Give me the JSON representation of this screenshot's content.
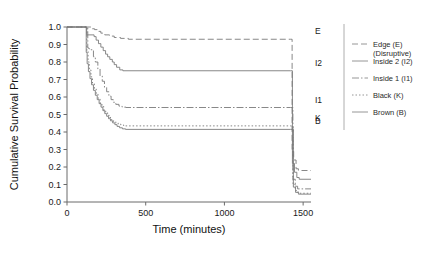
{
  "chart_data": {
    "type": "line",
    "subtype": "kaplan-meier-step",
    "title": "",
    "xlabel": "Time (minutes)",
    "ylabel": "Cumulative Survival Probability",
    "xlim": [
      0,
      1550
    ],
    "ylim": [
      0,
      1.0
    ],
    "xticks": [
      0,
      500,
      1000,
      1500
    ],
    "xtick_labels": [
      "0",
      "500",
      "1000",
      "1500"
    ],
    "yticks": [
      0.0,
      0.1,
      0.2,
      0.3,
      0.4,
      0.5,
      0.6,
      0.7,
      0.8,
      0.9,
      1.0
    ],
    "ytick_labels": [
      "0.0",
      "0.1",
      "0.2",
      "0.3",
      "0.4",
      "0.5",
      "0.6",
      "0.7",
      "0.8",
      "0.9",
      "1.0"
    ],
    "grid": false,
    "legend_position": "right",
    "series": [
      {
        "key": "E",
        "name": "Edge (E)",
        "name_line2": "(Disruptive)",
        "inplot_label": "E",
        "dash": "6,3",
        "color": "#7a7a7a",
        "plateau": 0.93,
        "points": [
          [
            0,
            1.0
          ],
          [
            150,
            1.0
          ],
          [
            160,
            0.99
          ],
          [
            175,
            0.985
          ],
          [
            195,
            0.975
          ],
          [
            215,
            0.965
          ],
          [
            240,
            0.955
          ],
          [
            270,
            0.948
          ],
          [
            300,
            0.94
          ],
          [
            340,
            0.935
          ],
          [
            390,
            0.93
          ],
          [
            1420,
            0.93
          ],
          [
            1430,
            0.3
          ],
          [
            1440,
            0.24
          ],
          [
            1455,
            0.19
          ],
          [
            1470,
            0.18
          ],
          [
            1550,
            0.18
          ]
        ]
      },
      {
        "key": "I2",
        "name": "Inside 2 (I2)",
        "name_line2": "",
        "inplot_label": "I2",
        "dash": "none",
        "color": "#6f6f6f",
        "plateau": 0.75,
        "points": [
          [
            0,
            1.0
          ],
          [
            120,
            1.0
          ],
          [
            125,
            0.955
          ],
          [
            165,
            0.955
          ],
          [
            172,
            0.945
          ],
          [
            185,
            0.925
          ],
          [
            200,
            0.905
          ],
          [
            215,
            0.885
          ],
          [
            230,
            0.865
          ],
          [
            245,
            0.845
          ],
          [
            258,
            0.83
          ],
          [
            272,
            0.815
          ],
          [
            288,
            0.8
          ],
          [
            300,
            0.785
          ],
          [
            315,
            0.77
          ],
          [
            335,
            0.755
          ],
          [
            355,
            0.75
          ],
          [
            1420,
            0.75
          ],
          [
            1432,
            0.22
          ],
          [
            1445,
            0.17
          ],
          [
            1460,
            0.14
          ],
          [
            1475,
            0.13
          ],
          [
            1550,
            0.13
          ]
        ]
      },
      {
        "key": "I1",
        "name": "Inside 1 (I1)",
        "name_line2": "",
        "inplot_label": "I1",
        "dash": "7,2,1.5,2",
        "color": "#8a8a8a",
        "plateau": 0.54,
        "points": [
          [
            0,
            1.0
          ],
          [
            128,
            1.0
          ],
          [
            132,
            0.88
          ],
          [
            140,
            0.875
          ],
          [
            152,
            0.87
          ],
          [
            168,
            0.83
          ],
          [
            180,
            0.8
          ],
          [
            196,
            0.76
          ],
          [
            210,
            0.72
          ],
          [
            224,
            0.69
          ],
          [
            238,
            0.655
          ],
          [
            252,
            0.63
          ],
          [
            266,
            0.605
          ],
          [
            280,
            0.585
          ],
          [
            294,
            0.57
          ],
          [
            310,
            0.558
          ],
          [
            330,
            0.548
          ],
          [
            350,
            0.542
          ],
          [
            375,
            0.54
          ],
          [
            1420,
            0.54
          ],
          [
            1435,
            0.13
          ],
          [
            1450,
            0.09
          ],
          [
            1465,
            0.075
          ],
          [
            1550,
            0.075
          ]
        ]
      },
      {
        "key": "K",
        "name": "Black (K)",
        "name_line2": "",
        "inplot_label": "K",
        "dash": "1.5,2",
        "color": "#8f8f8f",
        "plateau": 0.435,
        "points": [
          [
            0,
            1.0
          ],
          [
            122,
            1.0
          ],
          [
            126,
            0.86
          ],
          [
            134,
            0.8
          ],
          [
            142,
            0.755
          ],
          [
            152,
            0.715
          ],
          [
            162,
            0.68
          ],
          [
            174,
            0.645
          ],
          [
            186,
            0.615
          ],
          [
            198,
            0.59
          ],
          [
            210,
            0.565
          ],
          [
            222,
            0.545
          ],
          [
            234,
            0.525
          ],
          [
            246,
            0.51
          ],
          [
            258,
            0.495
          ],
          [
            270,
            0.483
          ],
          [
            282,
            0.47
          ],
          [
            296,
            0.46
          ],
          [
            310,
            0.452
          ],
          [
            325,
            0.445
          ],
          [
            342,
            0.44
          ],
          [
            360,
            0.435
          ],
          [
            1420,
            0.435
          ],
          [
            1436,
            0.1
          ],
          [
            1450,
            0.065
          ],
          [
            1468,
            0.05
          ],
          [
            1550,
            0.05
          ]
        ]
      },
      {
        "key": "B",
        "name": "Brown (B)",
        "name_line2": "",
        "inplot_label": "B",
        "dash": "none",
        "color": "#6a6a6a",
        "plateau": 0.415,
        "points": [
          [
            0,
            1.0
          ],
          [
            118,
            1.0
          ],
          [
            122,
            0.855
          ],
          [
            128,
            0.79
          ],
          [
            136,
            0.745
          ],
          [
            146,
            0.705
          ],
          [
            156,
            0.67
          ],
          [
            168,
            0.638
          ],
          [
            180,
            0.61
          ],
          [
            192,
            0.585
          ],
          [
            204,
            0.562
          ],
          [
            216,
            0.542
          ],
          [
            228,
            0.522
          ],
          [
            240,
            0.505
          ],
          [
            252,
            0.49
          ],
          [
            264,
            0.476
          ],
          [
            276,
            0.464
          ],
          [
            290,
            0.452
          ],
          [
            304,
            0.442
          ],
          [
            318,
            0.432
          ],
          [
            334,
            0.424
          ],
          [
            352,
            0.418
          ],
          [
            372,
            0.415
          ],
          [
            1420,
            0.415
          ],
          [
            1438,
            0.085
          ],
          [
            1452,
            0.055
          ],
          [
            1470,
            0.045
          ],
          [
            1550,
            0.045
          ]
        ]
      }
    ]
  },
  "legend": {
    "items": [
      {
        "label_line1": "Edge (E)",
        "label_line2": "(Disruptive)",
        "dash": "6,3"
      },
      {
        "label_line1": "Inside 2 (I2)",
        "label_line2": "",
        "dash": "none"
      },
      {
        "label_line1": "Inside 1 (I1)",
        "label_line2": "",
        "dash": "7,2,1.5,2"
      },
      {
        "label_line1": "Black (K)",
        "label_line2": "",
        "dash": "1.5,2"
      },
      {
        "label_line1": "Brown (B)",
        "label_line2": "",
        "dash": "none"
      }
    ]
  },
  "colors": {
    "axis": "#6b6b6b",
    "text": "#1a1a1a",
    "series": "#7a7a7a",
    "background": "#ffffff"
  }
}
